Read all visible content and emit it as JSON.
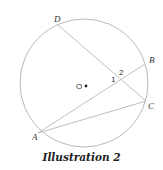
{
  "diagram": {
    "caption": "Illustration 2",
    "circle": {
      "center_label": "O",
      "stroke": "#b0b0b0"
    },
    "points": {
      "A": "A",
      "B": "B",
      "C": "C",
      "D": "D"
    },
    "segments": [
      "DC",
      "AB",
      "AC"
    ],
    "angles": {
      "angle1": "1",
      "angle2": "2"
    },
    "line_color": "#b8b8b8"
  }
}
